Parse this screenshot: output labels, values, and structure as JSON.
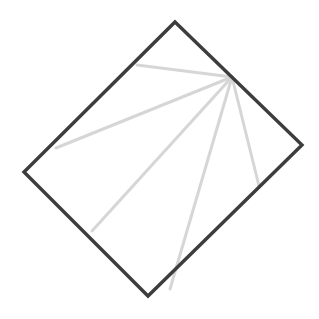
{
  "figure": {
    "canvas": {
      "width": 319,
      "height": 319,
      "background": "#ffffff"
    },
    "shapes": {
      "square": {
        "name": "rotated-square-outline",
        "stroke_color": "#3d3d3d",
        "stroke_width": 3.4,
        "fill": "none",
        "points": "175,22 302,145 148,296 24,172",
        "vertices": [
          {
            "label": "top",
            "x": 175,
            "y": 22
          },
          {
            "label": "right",
            "x": 302,
            "y": 145
          },
          {
            "label": "bottom",
            "x": 148,
            "y": 296
          },
          {
            "label": "left",
            "x": 24,
            "y": 172
          }
        ]
      },
      "fan": {
        "name": "radiating-crease-lines",
        "stroke_color": "#d6d6d6",
        "stroke_width": 3.0,
        "apex": {
          "x": 232,
          "y": 77
        },
        "lines": [
          {
            "label": "crease-1-upper-left",
            "x1": 232,
            "y1": 77,
            "x2": 137,
            "y2": 65
          },
          {
            "label": "crease-2-left",
            "x1": 232,
            "y1": 77,
            "x2": 56,
            "y2": 148
          },
          {
            "label": "crease-3-lower-left",
            "x1": 232,
            "y1": 77,
            "x2": 92,
            "y2": 231
          },
          {
            "label": "crease-4-bottom",
            "x1": 232,
            "y1": 77,
            "x2": 170,
            "y2": 289
          },
          {
            "label": "crease-5-lower-right",
            "x1": 232,
            "y1": 77,
            "x2": 259,
            "y2": 186
          }
        ]
      }
    }
  }
}
